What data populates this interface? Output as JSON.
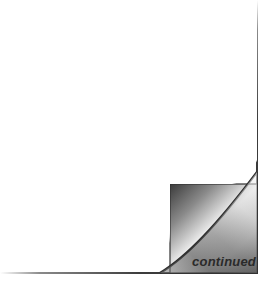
{
  "label": {
    "text": "continued"
  },
  "colors": {
    "page": "#ffffff",
    "edge": "#333333",
    "curl_dark": "#4a4a4a",
    "curl_light": "#f2f2f2",
    "text": "#2a2a2a"
  },
  "icon": "page-curl-icon"
}
